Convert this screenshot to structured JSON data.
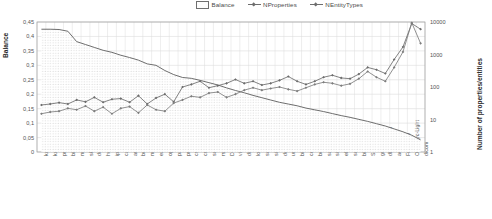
{
  "legend": {
    "position": "top-right",
    "items": [
      {
        "label": "Balance",
        "marker": "area-swatch"
      },
      {
        "label": "NProperties",
        "marker": "line-diamond"
      },
      {
        "label": "NEntityTypes",
        "marker": "line-diamond"
      }
    ]
  },
  "axes": {
    "left_title": "Balance",
    "right_title": "Number of properties/entities",
    "left_ticks": [
      "0,45",
      "0,4",
      "0,35",
      "0,3",
      "0,25",
      "0,2",
      "0,15",
      "0,1",
      "0,05",
      "0"
    ],
    "right_ticks": [
      "10000",
      "1000",
      "100",
      "10",
      "1"
    ]
  },
  "chart_data": {
    "type": "line",
    "title": "",
    "xlabel": "",
    "ylabel": "Balance",
    "y2label": "Number of properties/entities",
    "ylim": [
      0,
      0.45
    ],
    "y2lim": [
      1,
      10000
    ],
    "y2scale": "log",
    "grid": true,
    "legend_position": "top-right",
    "categories": [
      "kudo-gm",
      "kudo-gp",
      "premis",
      "bibjson",
      "mixo",
      "ski",
      "dcaprt",
      "hcal",
      "ip",
      "cal",
      "arp",
      "bondc",
      "md",
      "earth",
      "oprvoc",
      "pavel",
      "prod",
      "cs",
      "cms",
      "sucms",
      "rss",
      "DOLCE-DSnS",
      "vivo",
      "disco",
      "loc",
      "swpo",
      "sit",
      "dcps",
      "uniprot",
      "biotop",
      "cerno",
      "being",
      "saws",
      "sion",
      "ebsource",
      "schema",
      "bibo",
      "SUMO",
      "gndo",
      "dbpedia-owl",
      "aemsr",
      "FreeBase",
      "OpenCyc-Light",
      "dicom"
    ],
    "series": [
      {
        "name": "Balance",
        "axis": "left",
        "type": "area",
        "values": [
          0.425,
          0.425,
          0.424,
          0.418,
          0.382,
          0.372,
          0.362,
          0.352,
          0.345,
          0.335,
          0.327,
          0.318,
          0.305,
          0.3,
          0.282,
          0.268,
          0.258,
          0.255,
          0.248,
          0.24,
          0.232,
          0.222,
          0.213,
          0.205,
          0.196,
          0.188,
          0.18,
          0.172,
          0.166,
          0.16,
          0.152,
          0.146,
          0.14,
          0.133,
          0.126,
          0.12,
          0.113,
          0.106,
          0.098,
          0.09,
          0.08,
          0.07,
          0.058,
          0.042
        ]
      },
      {
        "name": "NProperties",
        "axis": "right",
        "type": "line",
        "values": [
          28,
          30,
          33,
          30,
          40,
          35,
          48,
          34,
          42,
          44,
          34,
          54,
          30,
          46,
          60,
          35,
          100,
          120,
          150,
          95,
          110,
          130,
          170,
          130,
          150,
          115,
          130,
          160,
          210,
          150,
          120,
          150,
          200,
          230,
          190,
          180,
          250,
          400,
          340,
          260,
          700,
          1700,
          9000,
          6000
        ]
      },
      {
        "name": "NEntityTypes",
        "axis": "right",
        "type": "line",
        "values": [
          15,
          17,
          18,
          22,
          20,
          26,
          18,
          24,
          15,
          22,
          25,
          16,
          28,
          20,
          18,
          32,
          40,
          52,
          48,
          65,
          70,
          48,
          60,
          80,
          95,
          80,
          90,
          100,
          85,
          75,
          95,
          120,
          140,
          130,
          110,
          125,
          180,
          300,
          200,
          150,
          400,
          1200,
          9500,
          2200
        ]
      }
    ]
  }
}
